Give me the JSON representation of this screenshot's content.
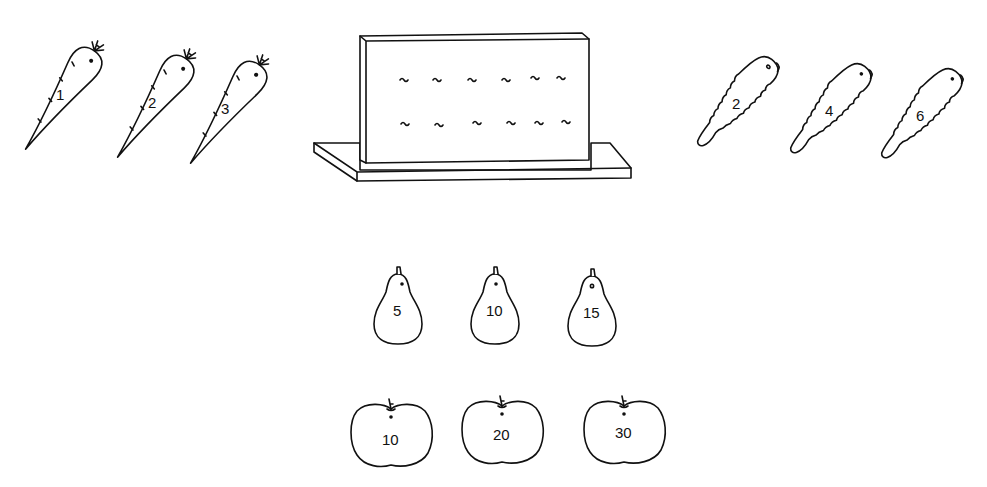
{
  "colors": {
    "line": "#111111",
    "background": "#ffffff"
  },
  "carrots": {
    "icon": "carrot-icon",
    "items": [
      {
        "label": "1",
        "x": 60,
        "y": 100,
        "rot": 35
      },
      {
        "label": "2",
        "x": 150,
        "y": 108,
        "rot": 35
      },
      {
        "label": "3",
        "x": 226,
        "y": 114,
        "rot": 35
      }
    ]
  },
  "pegboard": {
    "icon": "pegboard-icon",
    "rows": 2,
    "hooks_per_row": 6
  },
  "cucumbers": {
    "icon": "cucumber-icon",
    "items": [
      {
        "label": "2",
        "x": 735,
        "y": 105,
        "rot": 38
      },
      {
        "label": "4",
        "x": 827,
        "y": 112,
        "rot": 38
      },
      {
        "label": "6",
        "x": 918,
        "y": 116,
        "rot": 38
      }
    ]
  },
  "pears": {
    "icon": "pear-icon",
    "items": [
      {
        "label": "5",
        "x": 396,
        "y": 314
      },
      {
        "label": "10",
        "x": 494,
        "y": 314
      },
      {
        "label": "15",
        "x": 590,
        "y": 316
      }
    ]
  },
  "apples": {
    "icon": "apple-icon",
    "items": [
      {
        "label": "10",
        "x": 392,
        "y": 437
      },
      {
        "label": "20",
        "x": 504,
        "y": 435
      },
      {
        "label": "30",
        "x": 625,
        "y": 435
      }
    ]
  }
}
